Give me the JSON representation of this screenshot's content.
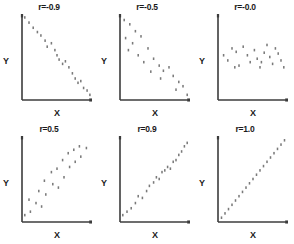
{
  "figure": {
    "background_color": "#ffffff",
    "point_color": "#7a7a7a",
    "axis_color": "#3c3c3c",
    "rows": 2,
    "cols": 3
  },
  "chart_data": [
    {
      "type": "scatter",
      "title": "r=-0.9",
      "xlabel": "X",
      "ylabel": "Y",
      "xlim": [
        0,
        100
      ],
      "ylim": [
        0,
        100
      ],
      "grid": false,
      "legend": "none",
      "x": [
        4,
        10,
        16,
        22,
        27,
        33,
        36,
        42,
        47,
        50,
        53,
        58,
        62,
        67,
        72,
        76,
        80,
        84,
        88,
        93,
        97
      ],
      "y": [
        96,
        90,
        84,
        79,
        75,
        69,
        62,
        66,
        58,
        52,
        47,
        42,
        45,
        38,
        31,
        25,
        20,
        22,
        14,
        11,
        6
      ]
    },
    {
      "type": "scatter",
      "title": "r=-0.5",
      "xlabel": "X",
      "ylabel": "Y",
      "xlim": [
        0,
        100
      ],
      "ylim": [
        0,
        100
      ],
      "grid": false,
      "legend": "none",
      "x": [
        6,
        14,
        22,
        8,
        18,
        30,
        12,
        26,
        40,
        34,
        48,
        56,
        44,
        62,
        70,
        58,
        76,
        84,
        90,
        80,
        96
      ],
      "y": [
        93,
        88,
        80,
        72,
        66,
        74,
        58,
        52,
        60,
        44,
        48,
        40,
        33,
        34,
        38,
        25,
        28,
        21,
        16,
        12,
        6
      ]
    },
    {
      "type": "scatter",
      "title": "r=-0.0",
      "xlabel": "X",
      "ylabel": "Y",
      "xlim": [
        0,
        100
      ],
      "ylim": [
        0,
        100
      ],
      "grid": false,
      "legend": "none",
      "x": [
        8,
        14,
        20,
        26,
        30,
        36,
        42,
        46,
        52,
        56,
        60,
        66,
        70,
        74,
        78,
        82,
        86,
        90,
        94,
        24,
        62
      ],
      "y": [
        52,
        46,
        60,
        56,
        40,
        62,
        52,
        44,
        58,
        48,
        38,
        55,
        64,
        50,
        42,
        60,
        54,
        46,
        38,
        38,
        44
      ]
    },
    {
      "type": "scatter",
      "title": "r=0.5",
      "xlabel": "X",
      "ylabel": "Y",
      "xlim": [
        0,
        100
      ],
      "ylim": [
        0,
        100
      ],
      "grid": false,
      "legend": "none",
      "x": [
        4,
        12,
        10,
        20,
        28,
        24,
        34,
        32,
        44,
        42,
        52,
        50,
        60,
        58,
        68,
        66,
        76,
        74,
        84,
        82,
        92
      ],
      "y": [
        8,
        12,
        26,
        22,
        18,
        36,
        32,
        48,
        44,
        58,
        40,
        62,
        52,
        72,
        64,
        80,
        70,
        84,
        76,
        88,
        86
      ]
    },
    {
      "type": "scatter",
      "title": "r=0.9",
      "xlabel": "X",
      "ylabel": "Y",
      "xlim": [
        0,
        100
      ],
      "ylim": [
        0,
        100
      ],
      "grid": false,
      "legend": "none",
      "x": [
        4,
        10,
        16,
        22,
        26,
        32,
        38,
        42,
        48,
        52,
        56,
        60,
        64,
        68,
        72,
        76,
        80,
        84,
        88,
        92,
        96
      ],
      "y": [
        8,
        12,
        16,
        22,
        30,
        28,
        36,
        42,
        46,
        52,
        50,
        58,
        60,
        64,
        62,
        70,
        72,
        78,
        82,
        88,
        92
      ]
    },
    {
      "type": "scatter",
      "title": "r=1.0",
      "xlabel": "X",
      "ylabel": "Y",
      "xlim": [
        0,
        100
      ],
      "ylim": [
        0,
        100
      ],
      "grid": false,
      "legend": "none",
      "x": [
        5,
        10,
        15,
        20,
        25,
        30,
        35,
        40,
        45,
        50,
        55,
        60,
        65,
        70,
        75,
        80,
        85,
        90,
        95
      ],
      "y": [
        5,
        10,
        15,
        20,
        25,
        30,
        35,
        40,
        45,
        50,
        55,
        60,
        65,
        70,
        75,
        80,
        85,
        90,
        95
      ]
    }
  ]
}
